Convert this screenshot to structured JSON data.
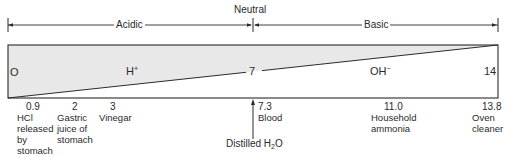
{
  "header": {
    "neutral_label": "Neutral",
    "acidic_label": "Acidic",
    "basic_label": "Basic"
  },
  "scale": {
    "min_label": "O",
    "mid_label": "7",
    "max_label": "14",
    "h_ion_base": "H",
    "h_ion_charge": "+",
    "oh_ion_base": "OH",
    "oh_ion_charge": "−"
  },
  "colors": {
    "acid_region_fill": "#e8e8e8",
    "base_region_fill": "#ffffff",
    "line": "#2a2a2a"
  },
  "examples": [
    {
      "ph": "0.9",
      "lines": [
        "HCl",
        "released",
        "by",
        "stomach"
      ]
    },
    {
      "ph": "2",
      "lines": [
        "Gastric",
        "juice of",
        "stomach"
      ]
    },
    {
      "ph": "3",
      "lines": [
        "Vinegar"
      ]
    },
    {
      "ph": "7.3",
      "lines": [
        "Blood"
      ]
    },
    {
      "ph": "11.0",
      "lines": [
        "Household",
        "ammonia"
      ]
    },
    {
      "ph": "13.8",
      "lines": [
        "Oven",
        "cleaner"
      ]
    }
  ],
  "pointer": {
    "label_base": "Distilled H",
    "label_sub": "2",
    "label_end": "O"
  }
}
